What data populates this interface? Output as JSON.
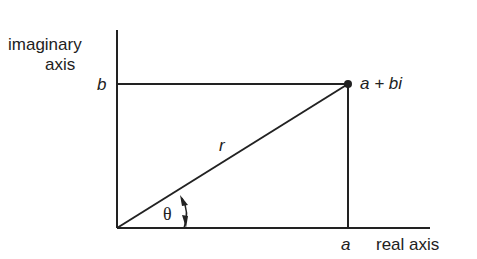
{
  "diagram": {
    "y_axis_label_line1": "imaginary",
    "y_axis_label_line2": "axis",
    "x_axis_label": "real axis",
    "b_label": "b",
    "a_label": "a",
    "point_label": "a + bi",
    "radius_label": "r",
    "angle_label": "θ",
    "line_color": "#222222"
  }
}
